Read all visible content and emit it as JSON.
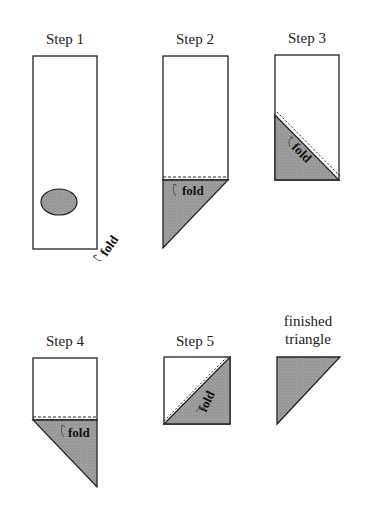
{
  "steps": [
    {
      "label": "Step 1",
      "fold_label": "fold"
    },
    {
      "label": "Step 2",
      "fold_label": "fold"
    },
    {
      "label": "Step 3",
      "fold_label": "fold"
    },
    {
      "label": "Step 4",
      "fold_label": "fold"
    },
    {
      "label": "Step 5",
      "fold_label": "fold"
    }
  ],
  "finished": {
    "line1": "finished",
    "line2": "triangle"
  },
  "colors": {
    "shade": "#9a9a9a",
    "stroke": "#222222"
  }
}
